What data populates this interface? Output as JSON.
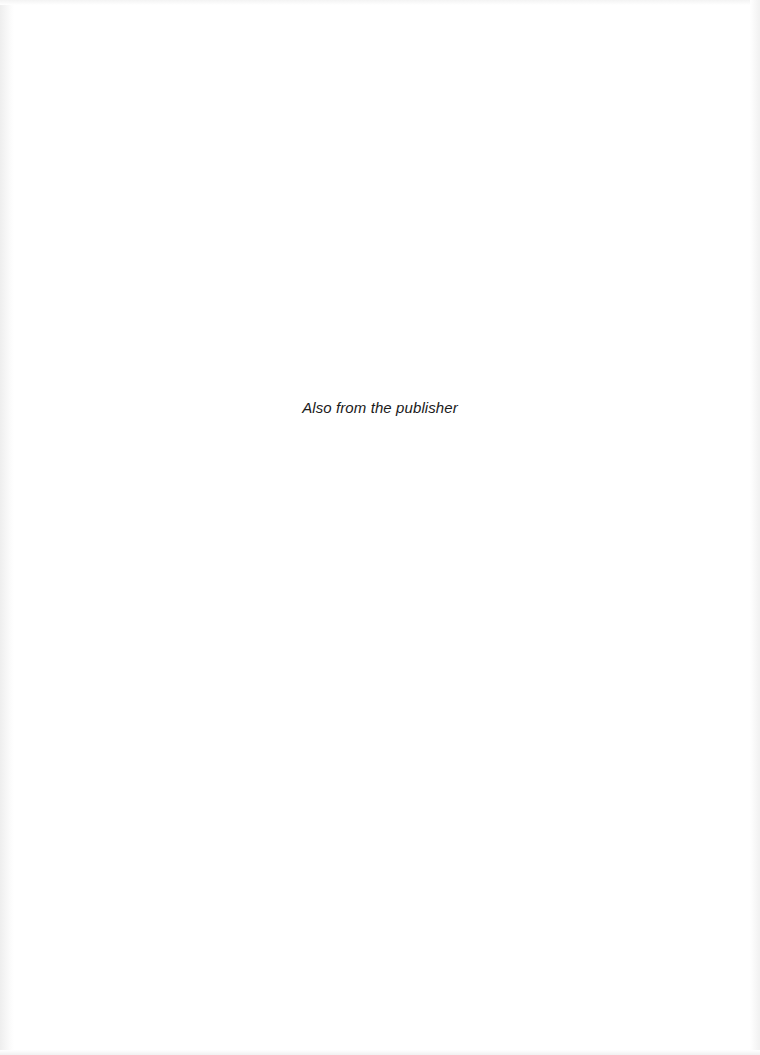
{
  "page": {
    "heading": "Also from the publisher"
  }
}
